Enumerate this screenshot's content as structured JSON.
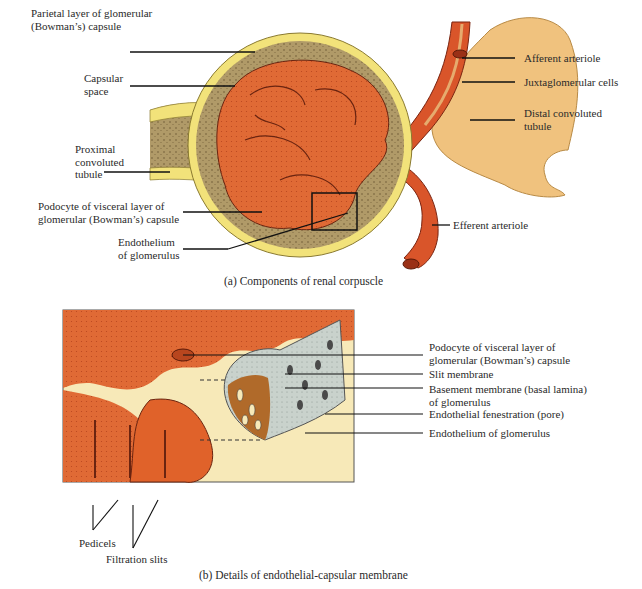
{
  "panel_a": {
    "caption": "(a) Components of renal corpuscle",
    "labels": {
      "parietal_layer": "Parietal layer of glomerular\n(Bowman’s) capsule",
      "capsular_space": "Capsular\nspace",
      "proximal_tubule": "Proximal\nconvoluted\ntubule",
      "podocyte": "Podocyte of visceral layer of\nglomerular (Bowman’s) capsule",
      "endothelium": "Endothelium\nof glomerulus",
      "afferent_arteriole": "Afferent arteriole",
      "juxtaglomerular_cells": "Juxtaglomerular cells",
      "distal_tubule": "Distal convoluted\ntubule",
      "efferent_arteriole": "Efferent arteriole"
    }
  },
  "panel_b": {
    "caption": "(b) Details of endothelial-capsular membrane",
    "labels": {
      "podocyte": "Podocyte of visceral layer of\nglomerular (Bowman’s) capsule",
      "slit_membrane": "Slit membrane",
      "basement_membrane": "Basement membrane (basal lamina)\nof glomerulus",
      "endothelial_fenestration": "Endothelial fenestration (pore)",
      "endothelium": "Endothelium of glomerulus",
      "pedicels": "Pedicels",
      "filtration_slits": "Filtration slits"
    }
  },
  "colors": {
    "vessel_red": "#d9552a",
    "tubule_yellow": "#f2e27a",
    "distal_tan": "#f0c27e",
    "capsule_brown": "#a89060",
    "panel_bg": "#f7e9b8",
    "membrane_gray": "#c9d2cc"
  }
}
